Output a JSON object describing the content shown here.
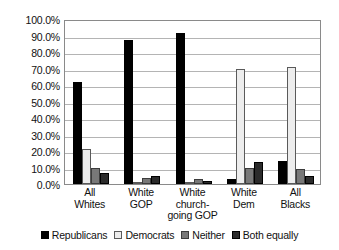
{
  "chart_data": {
    "type": "bar",
    "title": "",
    "subtitle": "",
    "xlabel": "",
    "ylabel": "",
    "ylim": [
      0,
      100
    ],
    "ytick_labels": [
      "100.0%",
      "90.0%",
      "80.0%",
      "70.0%",
      "60.0%",
      "50.0%",
      "40.0%",
      "30.0%",
      "20.0%",
      "10.0%",
      "0.0%"
    ],
    "ytick_values": [
      100,
      90,
      80,
      70,
      60,
      50,
      40,
      30,
      20,
      10,
      0
    ],
    "grid": true,
    "legend_position": "bottom",
    "categories": [
      "All Whites",
      "White GOP",
      "White church-going GOP",
      "White Dem",
      "All Blacks"
    ],
    "category_lines": [
      [
        "All",
        "Whites"
      ],
      [
        "White",
        "GOP"
      ],
      [
        "White",
        "church-",
        "going GOP"
      ],
      [
        "White",
        "Dem"
      ],
      [
        "All",
        "Blacks"
      ]
    ],
    "series": [
      {
        "name": "Republicans",
        "color": "#000000",
        "values": [
          62.0,
          87.0,
          91.5,
          3.0,
          14.0
        ]
      },
      {
        "name": "Democrats",
        "color": "#ededed",
        "values": [
          21.5,
          0.5,
          0.5,
          70.0,
          71.0
        ]
      },
      {
        "name": "Neither",
        "color": "#787878",
        "values": [
          10.0,
          3.5,
          3.0,
          10.0,
          9.0
        ]
      },
      {
        "name": "Both equally",
        "color": "#2b2b2b",
        "values": [
          6.5,
          5.0,
          2.0,
          13.5,
          5.0
        ]
      }
    ]
  },
  "legend": {
    "items": [
      {
        "label": "Republicans",
        "swatch": "black-square-icon"
      },
      {
        "label": "Democrats",
        "swatch": "white-square-icon"
      },
      {
        "label": "Neither",
        "swatch": "gray-square-icon"
      },
      {
        "label": "Both equally",
        "swatch": "dark-gray-square-icon"
      }
    ]
  }
}
